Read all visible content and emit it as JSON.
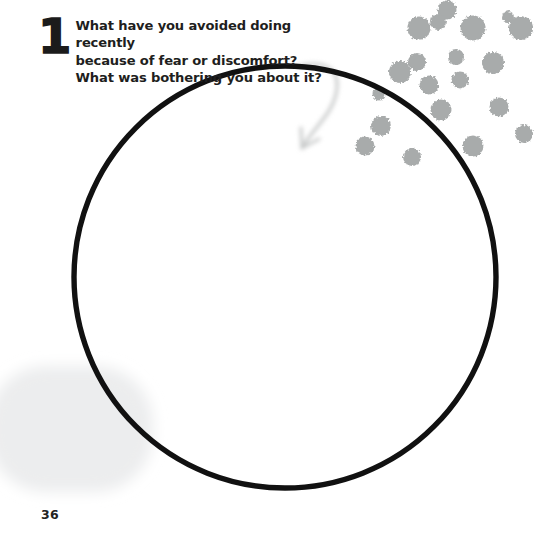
{
  "page": {
    "page_number": "36",
    "background_color": "#ffffff"
  },
  "prompt": {
    "number": "1",
    "question": "What have you avoided doing recently\nbecause of fear or discomfort?\nWhat was bothering you about it?",
    "lines": [
      "What have you avoided doing recently",
      "because of fear or discomfort?",
      "What was bothering you about it?"
    ],
    "text_color": "#1e1e20"
  },
  "answer_circle": {
    "shape": "circle",
    "center_x": 285,
    "center_y": 277,
    "radius": 211,
    "stroke_width": 5.4,
    "stroke_color": "#111111",
    "fill": "none",
    "label": "handwriting answer space"
  },
  "arrow": {
    "icon": "curved-arrow-icon",
    "color": "#c9cbcb",
    "stroke_width": 3.1,
    "description": "light gray curved arrow hooking from the question text down into the circle",
    "start_x": 300,
    "start_y": 66,
    "end_x": 302,
    "end_y": 147
  },
  "decorations": {
    "splatter": {
      "name": "ink-splatter-dots",
      "color": "#a8abab",
      "count": 20,
      "dots": [
        {
          "cx": 447,
          "cy": 10,
          "r": 9.5
        },
        {
          "cx": 508,
          "cy": 17,
          "r": 6.0
        },
        {
          "cx": 438,
          "cy": 22,
          "r": 8.0
        },
        {
          "cx": 419,
          "cy": 28,
          "r": 11.5
        },
        {
          "cx": 473,
          "cy": 28,
          "r": 12.5
        },
        {
          "cx": 521,
          "cy": 28,
          "r": 12.0
        },
        {
          "cx": 456,
          "cy": 57,
          "r": 8.0
        },
        {
          "cx": 417,
          "cy": 62,
          "r": 9.0
        },
        {
          "cx": 493,
          "cy": 63,
          "r": 11.0
        },
        {
          "cx": 400,
          "cy": 72,
          "r": 11.0
        },
        {
          "cx": 460,
          "cy": 80,
          "r": 8.5
        },
        {
          "cx": 429,
          "cy": 85,
          "r": 9.5
        },
        {
          "cx": 379,
          "cy": 94,
          "r": 6.5
        },
        {
          "cx": 499,
          "cy": 107,
          "r": 9.5
        },
        {
          "cx": 441,
          "cy": 110,
          "r": 10.5
        },
        {
          "cx": 381,
          "cy": 126,
          "r": 10.0
        },
        {
          "cx": 524,
          "cy": 134,
          "r": 9.0
        },
        {
          "cx": 473,
          "cy": 146,
          "r": 10.5
        },
        {
          "cx": 412,
          "cy": 157,
          "r": 9.0
        },
        {
          "cx": 365,
          "cy": 146,
          "r": 9.5
        }
      ]
    },
    "smudge": {
      "name": "gray-paint-smudge",
      "color": "#ecedee",
      "x": -12,
      "y": 366,
      "width": 165,
      "height": 126
    }
  }
}
